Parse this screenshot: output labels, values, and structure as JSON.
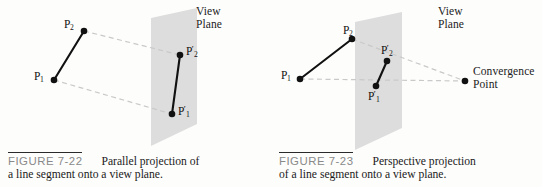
{
  "figures": [
    {
      "id": "figure-7-22",
      "number": "FIGURE 7-22",
      "caption_line1": "Parallel projection of",
      "caption_line2": "a line segment onto a view plane.",
      "plane_label": "View\nPlane",
      "points": [
        {
          "name": "P1",
          "label": "P",
          "sub": "1",
          "prime": ""
        },
        {
          "name": "P2",
          "label": "P",
          "sub": "2",
          "prime": ""
        },
        {
          "name": "P1p",
          "label": "P",
          "sub": "1",
          "prime": "′"
        },
        {
          "name": "P2p",
          "label": "P",
          "sub": "2",
          "prime": "′"
        }
      ],
      "projection_type": "parallel"
    },
    {
      "id": "figure-7-23",
      "number": "FIGURE 7-23",
      "caption_line1": "Perspective projection",
      "caption_line2": "of a line segment onto a view plane.",
      "plane_label": "View\nPlane",
      "convergence_label": "Convergence\nPoint",
      "points": [
        {
          "name": "P1",
          "label": "P",
          "sub": "1",
          "prime": ""
        },
        {
          "name": "P2",
          "label": "P",
          "sub": "2",
          "prime": ""
        },
        {
          "name": "P1p",
          "label": "P",
          "sub": "1",
          "prime": "′"
        },
        {
          "name": "P2p",
          "label": "P",
          "sub": "2",
          "prime": "′"
        }
      ],
      "projection_type": "perspective"
    }
  ],
  "colors": {
    "plane_fill": "#dddddd",
    "segment_stroke": "#111111",
    "projector_stroke": "#c9c9c9",
    "figure_number": "#8a8a8a",
    "rule": "#2a2a2a",
    "text": "#1a1a1a",
    "background": "#fdfdfc"
  },
  "left_geometry": {
    "plane_polygon": "151,18 197,8 197,124 151,146",
    "segment": {
      "x1": 54,
      "y1": 80,
      "x2": 84,
      "y2": 31
    },
    "projector_top": {
      "x1": 84,
      "y1": 31,
      "x2": 180,
      "y2": 55
    },
    "projector_bottom": {
      "x1": 54,
      "y1": 80,
      "x2": 172,
      "y2": 114
    },
    "projected_segment": {
      "x1": 172,
      "y1": 114,
      "x2": 180,
      "y2": 55
    },
    "dots": [
      {
        "name": "P1",
        "cx": 54,
        "cy": 80
      },
      {
        "name": "P2",
        "cx": 84,
        "cy": 31
      },
      {
        "name": "P1p",
        "cx": 172,
        "cy": 114
      },
      {
        "name": "P2p",
        "cx": 180,
        "cy": 55
      }
    ]
  },
  "right_geometry": {
    "plane_polygon": "84,22 131,12 131,128 84,150",
    "segment": {
      "x1": 29,
      "y1": 79,
      "x2": 81,
      "y2": 39
    },
    "projector_top": {
      "x1": 81,
      "y1": 39,
      "x2": 194,
      "y2": 81
    },
    "projector_bottom": {
      "x1": 29,
      "y1": 79,
      "x2": 194,
      "y2": 81
    },
    "projected_segment": {
      "x1": 105,
      "y1": 86,
      "x2": 116,
      "y2": 61
    },
    "convergence_dot": {
      "cx": 194,
      "cy": 81
    },
    "dots": [
      {
        "name": "P1",
        "cx": 29,
        "cy": 79
      },
      {
        "name": "P2",
        "cx": 81,
        "cy": 39
      },
      {
        "name": "P1p",
        "cx": 105,
        "cy": 86
      },
      {
        "name": "P2p",
        "cx": 116,
        "cy": 61
      },
      {
        "name": "ConvergencePoint",
        "cx": 194,
        "cy": 81
      }
    ]
  }
}
